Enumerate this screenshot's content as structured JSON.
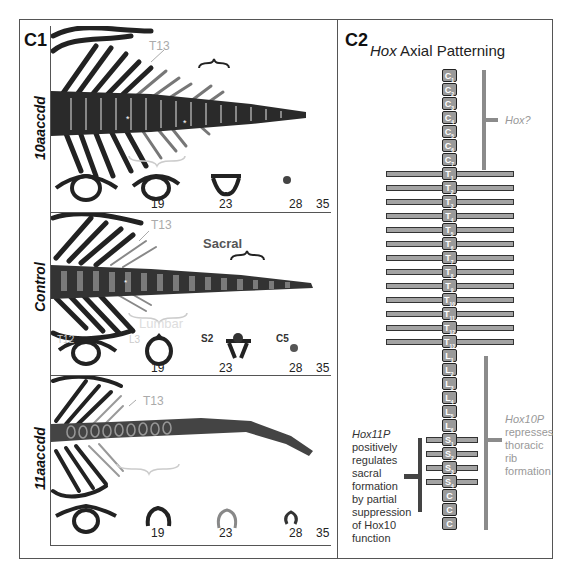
{
  "figure": {
    "c1": {
      "label": "C1",
      "panels": [
        {
          "genotype": "10aaccdd",
          "labels": {
            "t13": "T13"
          },
          "section_numbers": [
            "19",
            "23",
            "28",
            "35"
          ]
        },
        {
          "genotype": "Control",
          "labels": {
            "t13": "T13",
            "sacral": "Sacral",
            "lumbar": "Lumbar",
            "t12": "T12",
            "l3": "L3",
            "s2": "S2",
            "c5": "C5"
          },
          "section_numbers": [
            "19",
            "23",
            "28",
            "35"
          ]
        },
        {
          "genotype": "11aaccdd",
          "labels": {
            "t13": "T13"
          },
          "section_numbers": [
            "19",
            "23",
            "28",
            "35"
          ]
        }
      ]
    },
    "c2": {
      "label": "C2",
      "title_italic": "Hox",
      "title_rest": " Axial Patterning",
      "vertebrae": [
        {
          "letter": "C",
          "sub": "1",
          "region": "cervical"
        },
        {
          "letter": "C",
          "sub": "2",
          "region": "cervical"
        },
        {
          "letter": "C",
          "sub": "3",
          "region": "cervical"
        },
        {
          "letter": "C",
          "sub": "4",
          "region": "cervical"
        },
        {
          "letter": "C",
          "sub": "5",
          "region": "cervical"
        },
        {
          "letter": "C",
          "sub": "6",
          "region": "cervical"
        },
        {
          "letter": "C",
          "sub": "7",
          "region": "cervical"
        },
        {
          "letter": "T",
          "sub": "1",
          "region": "thoracic"
        },
        {
          "letter": "T",
          "sub": "2",
          "region": "thoracic"
        },
        {
          "letter": "T",
          "sub": "3",
          "region": "thoracic"
        },
        {
          "letter": "T",
          "sub": "4",
          "region": "thoracic"
        },
        {
          "letter": "T",
          "sub": "5",
          "region": "thoracic"
        },
        {
          "letter": "T",
          "sub": "6",
          "region": "thoracic"
        },
        {
          "letter": "T",
          "sub": "7",
          "region": "thoracic"
        },
        {
          "letter": "T",
          "sub": "8",
          "region": "thoracic"
        },
        {
          "letter": "T",
          "sub": "9",
          "region": "thoracic"
        },
        {
          "letter": "T",
          "sub": "10",
          "region": "thoracic"
        },
        {
          "letter": "T",
          "sub": "11",
          "region": "thoracic"
        },
        {
          "letter": "T",
          "sub": "12",
          "region": "thoracic"
        },
        {
          "letter": "T",
          "sub": "13",
          "region": "thoracic"
        },
        {
          "letter": "L",
          "sub": "1",
          "region": "lumbar"
        },
        {
          "letter": "L",
          "sub": "2",
          "region": "lumbar"
        },
        {
          "letter": "L",
          "sub": "3",
          "region": "lumbar"
        },
        {
          "letter": "L",
          "sub": "4",
          "region": "lumbar"
        },
        {
          "letter": "L",
          "sub": "5",
          "region": "lumbar"
        },
        {
          "letter": "L",
          "sub": "6",
          "region": "lumbar"
        },
        {
          "letter": "S",
          "sub": "1",
          "region": "sacral"
        },
        {
          "letter": "S",
          "sub": "2",
          "region": "sacral"
        },
        {
          "letter": "S",
          "sub": "3",
          "region": "sacral"
        },
        {
          "letter": "S",
          "sub": "4",
          "region": "sacral"
        },
        {
          "letter": "C",
          "sub": "",
          "region": "caudal"
        },
        {
          "letter": "C",
          "sub": "",
          "region": "caudal"
        },
        {
          "letter": "C",
          "sub": "",
          "region": "caudal"
        }
      ],
      "annotations": {
        "hox_q": "Hox?",
        "hox10p": [
          "Hox10P",
          "represses",
          "thoracic",
          "rib",
          "formation"
        ],
        "hox11p": [
          "Hox11P",
          "positively",
          "regulates",
          "sacral",
          "formation",
          "by partial",
          "suppression",
          "of Hox10",
          "function"
        ]
      },
      "colors": {
        "vertebra_fill": "#9a9a9a",
        "rib_fill": "#a3a3a3",
        "hox10_bar": "#8b8b8b",
        "hox11_bar": "#444444",
        "hox10_text": "#999999",
        "hox11_text": "#333333"
      }
    }
  }
}
